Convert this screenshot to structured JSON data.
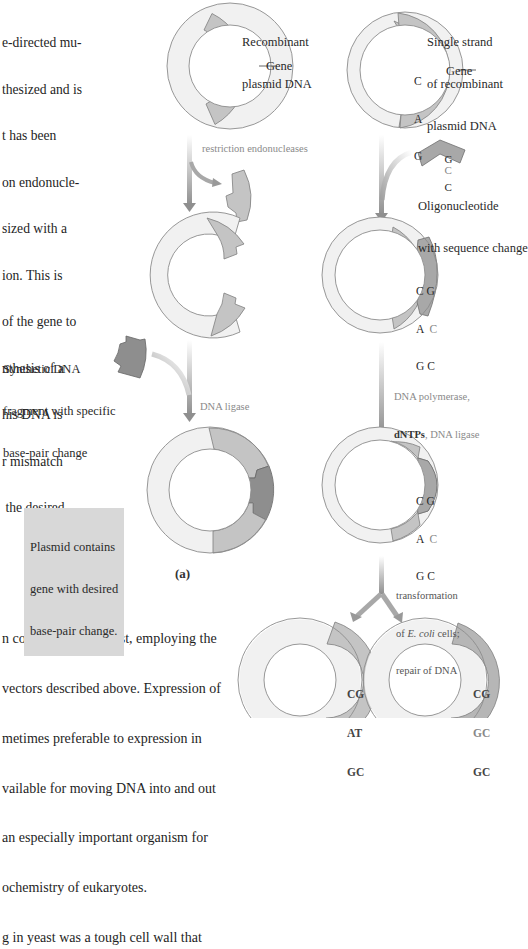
{
  "left_text_top": {
    "lines": [
      "e-directed mu-",
      "thesized and is",
      "t has been",
      "on endonucle-",
      "sized with a",
      "ion. This is",
      "of the gene to",
      "nthesis of a",
      "his DNA is",
      "r mismatch",
      " the desired"
    ]
  },
  "left_text_bottom": {
    "lines": [
      "n constructed for yeast, employing the",
      "vectors described above. Expression of",
      "metimes preferable to expression in",
      "vailable for moving DNA into and out",
      "an especially important organism for",
      "ochemistry of eukaryotes.",
      "g in yeast was a tough cell wall that"
    ]
  },
  "panel_a": {
    "panel_label": "(a)",
    "recombinant_label": [
      "Recombinant",
      "plasmid DNA"
    ],
    "gene_label": "Gene",
    "step1_label": "restriction endonucleases",
    "synthetic_label": [
      "Synthetic DNA",
      "fragment with specific",
      "base-pair change"
    ],
    "step2_label": "DNA ligase",
    "result_label": [
      "Plasmid contains",
      "gene with desired",
      "base-pair change."
    ]
  },
  "panel_b": {
    "single_strand_label": [
      "Single strand",
      "of recombinant",
      "plasmid DNA"
    ],
    "gene_label": "Gene",
    "gene_bases": [
      "C",
      "A",
      "G"
    ],
    "oligo_bases": [
      "G",
      "C",
      "C"
    ],
    "oligo_label": [
      "Oligonucleotide",
      "with sequence change"
    ],
    "annealed_pairs": [
      [
        "C",
        "G"
      ],
      [
        "A",
        "C"
      ],
      [
        "G",
        "C"
      ]
    ],
    "step_polymerase": {
      "line1": "DNA polymerase,",
      "line2_bold": "dNTPs",
      "line2_rest": ", DNA ligase"
    },
    "step_transformation": {
      "line1": "transformation",
      "line2_prefix": "of ",
      "line2_italic": "E. coli",
      "line2_suffix": " cells;",
      "line3": "repair of DNA"
    },
    "product_left_pairs": [
      [
        "C",
        "G"
      ],
      [
        "A",
        "T"
      ],
      [
        "G",
        "C"
      ]
    ],
    "product_right_pairs": [
      [
        "C",
        "G"
      ],
      [
        "G",
        "C"
      ],
      [
        "G",
        "C"
      ]
    ]
  },
  "colors": {
    "ring_light": "#f1f1f1",
    "ring_outline": "#8c8c8c",
    "gene_grey": "#c4c4c4",
    "fragment_dark": "#8e8e8e",
    "arrow_grey": "#9a9a9a",
    "callout_bg": "#d8d8d8",
    "mutant_base": "#888888"
  }
}
